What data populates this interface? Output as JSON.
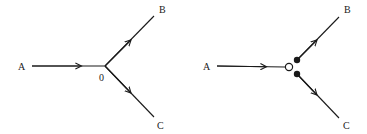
{
  "diagrams": [
    {
      "id": "left",
      "labels": {
        "a": "A",
        "b": "B",
        "c": "C",
        "junction": "0"
      },
      "junction_style": "plain"
    },
    {
      "id": "right",
      "labels": {
        "a": "A",
        "b": "B",
        "c": "C"
      },
      "junction_style": "open-circle-with-filled-dots"
    }
  ],
  "colors": {
    "ink": "#1a1a1a",
    "background": "#ffffff"
  }
}
